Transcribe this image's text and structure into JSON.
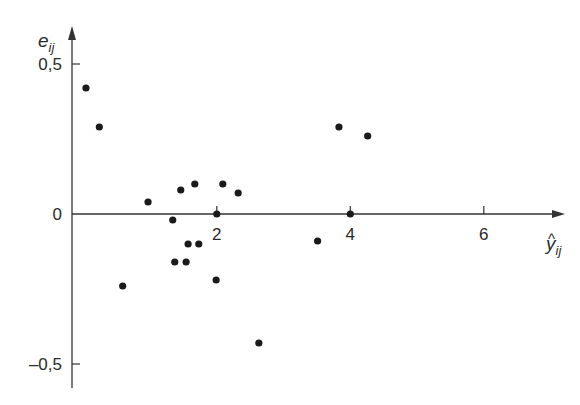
{
  "chart_data": {
    "type": "scatter",
    "title": "",
    "xlabel": "ŷ_ij",
    "ylabel": "e_ij",
    "xlabel_base": "y",
    "xlabel_sub": "ij",
    "ylabel_base": "e",
    "ylabel_sub": "ij",
    "x_ticks": [
      2,
      4,
      6
    ],
    "x_tick_labels": [
      "2",
      "4",
      "6"
    ],
    "y_ticks": [
      0.5,
      0,
      -0.5
    ],
    "y_tick_labels": [
      "0,5",
      "0",
      "–0,5"
    ],
    "xlim": [
      -0.15,
      7.2
    ],
    "ylim": [
      -0.58,
      0.62
    ],
    "grid": false,
    "legend": null,
    "series": [
      {
        "name": "residuals",
        "points": [
          {
            "x": 0.04,
            "y": 0.42
          },
          {
            "x": 0.24,
            "y": 0.29
          },
          {
            "x": 0.59,
            "y": -0.24
          },
          {
            "x": 0.97,
            "y": 0.04
          },
          {
            "x": 1.34,
            "y": -0.02
          },
          {
            "x": 1.37,
            "y": -0.16
          },
          {
            "x": 1.46,
            "y": 0.08
          },
          {
            "x": 1.54,
            "y": -0.16
          },
          {
            "x": 1.57,
            "y": -0.1
          },
          {
            "x": 1.67,
            "y": 0.1
          },
          {
            "x": 1.73,
            "y": -0.1
          },
          {
            "x": 1.99,
            "y": -0.22
          },
          {
            "x": 2.0,
            "y": 0.0
          },
          {
            "x": 2.09,
            "y": 0.1
          },
          {
            "x": 2.32,
            "y": 0.07
          },
          {
            "x": 2.63,
            "y": -0.43
          },
          {
            "x": 3.51,
            "y": -0.09
          },
          {
            "x": 3.83,
            "y": 0.29
          },
          {
            "x": 4.0,
            "y": 0.0
          },
          {
            "x": 4.26,
            "y": 0.26
          }
        ]
      }
    ]
  },
  "colors": {
    "axis": "#333333",
    "point": "#1a1a1a",
    "text": "#2a2a2a"
  }
}
